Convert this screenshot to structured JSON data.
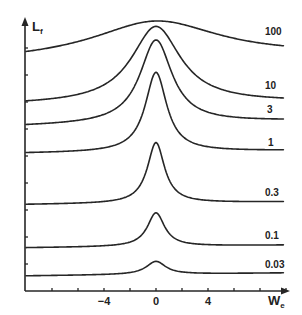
{
  "chart_data": {
    "type": "line",
    "title": "",
    "xlabel": "W",
    "xlabel_subscript": "e",
    "ylabel": "L",
    "ylabel_subscript": "f",
    "x_ticks": [
      -10,
      -8,
      -6,
      -4,
      -2,
      0,
      2,
      4,
      6,
      8,
      10
    ],
    "x_tick_labels": [
      {
        "value": -4,
        "label": "−4"
      },
      {
        "value": 0,
        "label": "0"
      },
      {
        "value": 4,
        "label": "4"
      }
    ],
    "xlim": [
      -10,
      10.2
    ],
    "ylim": [
      0,
      10.4
    ],
    "y_ticks": [
      1,
      2,
      3,
      4,
      5,
      6,
      7,
      8,
      9
    ],
    "y_tick_labels": [],
    "grid": false,
    "legend": "inline labels at right end of each curve",
    "series": [
      {
        "name": "100",
        "label": "100",
        "baseline_left": 8.5,
        "baseline_right": 8.7,
        "peak": 10.0,
        "width": 6.0
      },
      {
        "name": "10",
        "label": "10",
        "baseline_left": 6.9,
        "baseline_right": 7.0,
        "peak": 9.8,
        "width": 2.3
      },
      {
        "name": "3",
        "label": "3",
        "baseline_left": 6.1,
        "baseline_right": 6.3,
        "peak": 9.3,
        "width": 1.5
      },
      {
        "name": "1",
        "label": "1",
        "baseline_left": 5.1,
        "baseline_right": 5.2,
        "peak": 8.1,
        "width": 1.0
      },
      {
        "name": "0.3",
        "label": "0.3",
        "baseline_left": 3.2,
        "baseline_right": 3.3,
        "peak": 5.5,
        "width": 0.8
      },
      {
        "name": "0.1",
        "label": "0.1",
        "baseline_left": 1.6,
        "baseline_right": 1.7,
        "peak": 2.9,
        "width": 0.8
      },
      {
        "name": "0.03",
        "label": "0.03",
        "baseline_left": 0.56,
        "baseline_right": 0.67,
        "peak": 1.1,
        "width": 0.9
      }
    ]
  },
  "colors": {
    "ink": "#262626",
    "background": "#ffffff"
  }
}
